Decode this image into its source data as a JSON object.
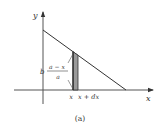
{
  "diagram": {
    "axis_labels": {
      "x": "x",
      "y": "y"
    },
    "height_label": {
      "prefix": "b",
      "numerator": "a − x",
      "denominator": "a"
    },
    "strip_labels": {
      "left": "x",
      "right": "x + dx"
    },
    "caption": "(a)",
    "colors": {
      "line": "#333333",
      "strip_fill": "#999999",
      "axis": "#555555"
    }
  }
}
